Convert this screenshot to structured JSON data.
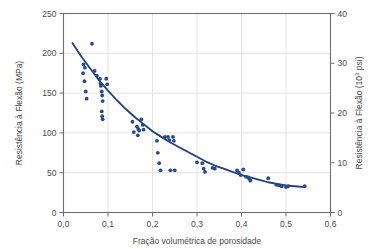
{
  "chart_data": {
    "type": "scatter",
    "title": "",
    "xlabel": "Fração volumétrica de porosidade",
    "ylabel": "Resistência à Flexão (MPa)",
    "ylabel_right_main": "Resistência à Flexão (10",
    "ylabel_right_sup": "3",
    "ylabel_right_tail": " psi)",
    "ylabel_right_full": "Resistência à Flexão (10³ psi)",
    "xlim": [
      0.0,
      0.6
    ],
    "ylim": [
      0,
      250
    ],
    "ylim_right": [
      0,
      40
    ],
    "grid": true,
    "legend": "none",
    "xticks": [
      0.0,
      0.1,
      0.2,
      0.3,
      0.4,
      0.5,
      0.6
    ],
    "xticklabels": [
      "0,0",
      "0,1",
      "0,2",
      "0,3",
      "0,4",
      "0,5",
      "0,6"
    ],
    "yticks": [
      0,
      50,
      100,
      150,
      200,
      250
    ],
    "yticklabels": [
      "0",
      "50",
      "100",
      "150",
      "200",
      "250"
    ],
    "yticks_right": [
      0,
      10,
      20,
      30,
      40
    ],
    "yticklabels_right": [
      "0",
      "10",
      "20",
      "30",
      "40"
    ],
    "marker_color": "#2b4a8b",
    "line_color": "#22407e",
    "grid_color": "#e3e3e3",
    "axis_color": "#6e6e6e",
    "points": [
      {
        "x": 0.045,
        "y": 186
      },
      {
        "x": 0.048,
        "y": 182
      },
      {
        "x": 0.044,
        "y": 175
      },
      {
        "x": 0.047,
        "y": 165
      },
      {
        "x": 0.05,
        "y": 152
      },
      {
        "x": 0.052,
        "y": 143
      },
      {
        "x": 0.064,
        "y": 212
      },
      {
        "x": 0.07,
        "y": 178
      },
      {
        "x": 0.075,
        "y": 172
      },
      {
        "x": 0.082,
        "y": 168
      },
      {
        "x": 0.083,
        "y": 162
      },
      {
        "x": 0.084,
        "y": 159
      },
      {
        "x": 0.086,
        "y": 152
      },
      {
        "x": 0.087,
        "y": 147
      },
      {
        "x": 0.088,
        "y": 140
      },
      {
        "x": 0.086,
        "y": 127
      },
      {
        "x": 0.087,
        "y": 121
      },
      {
        "x": 0.088,
        "y": 117
      },
      {
        "x": 0.096,
        "y": 168
      },
      {
        "x": 0.098,
        "y": 161
      },
      {
        "x": 0.155,
        "y": 114
      },
      {
        "x": 0.158,
        "y": 101
      },
      {
        "x": 0.165,
        "y": 108
      },
      {
        "x": 0.168,
        "y": 105
      },
      {
        "x": 0.17,
        "y": 103
      },
      {
        "x": 0.167,
        "y": 97
      },
      {
        "x": 0.175,
        "y": 117
      },
      {
        "x": 0.178,
        "y": 110
      },
      {
        "x": 0.18,
        "y": 104
      },
      {
        "x": 0.21,
        "y": 90
      },
      {
        "x": 0.212,
        "y": 75
      },
      {
        "x": 0.215,
        "y": 62
      },
      {
        "x": 0.218,
        "y": 53
      },
      {
        "x": 0.228,
        "y": 95
      },
      {
        "x": 0.235,
        "y": 95
      },
      {
        "x": 0.238,
        "y": 91
      },
      {
        "x": 0.24,
        "y": 53
      },
      {
        "x": 0.246,
        "y": 95
      },
      {
        "x": 0.248,
        "y": 90
      },
      {
        "x": 0.25,
        "y": 53
      },
      {
        "x": 0.3,
        "y": 63
      },
      {
        "x": 0.312,
        "y": 62
      },
      {
        "x": 0.315,
        "y": 55
      },
      {
        "x": 0.318,
        "y": 51
      },
      {
        "x": 0.335,
        "y": 56
      },
      {
        "x": 0.34,
        "y": 55
      },
      {
        "x": 0.39,
        "y": 53
      },
      {
        "x": 0.394,
        "y": 50
      },
      {
        "x": 0.398,
        "y": 47
      },
      {
        "x": 0.404,
        "y": 54
      },
      {
        "x": 0.41,
        "y": 45
      },
      {
        "x": 0.415,
        "y": 44
      },
      {
        "x": 0.418,
        "y": 42
      },
      {
        "x": 0.42,
        "y": 40
      },
      {
        "x": 0.46,
        "y": 43
      },
      {
        "x": 0.478,
        "y": 35
      },
      {
        "x": 0.484,
        "y": 34
      },
      {
        "x": 0.49,
        "y": 33
      },
      {
        "x": 0.5,
        "y": 32
      },
      {
        "x": 0.505,
        "y": 33
      },
      {
        "x": 0.542,
        "y": 33
      }
    ],
    "fit_curve": [
      {
        "x": 0.02,
        "y": 213
      },
      {
        "x": 0.04,
        "y": 196
      },
      {
        "x": 0.06,
        "y": 181
      },
      {
        "x": 0.08,
        "y": 166
      },
      {
        "x": 0.1,
        "y": 153
      },
      {
        "x": 0.12,
        "y": 141
      },
      {
        "x": 0.14,
        "y": 130
      },
      {
        "x": 0.16,
        "y": 120
      },
      {
        "x": 0.18,
        "y": 111
      },
      {
        "x": 0.2,
        "y": 102
      },
      {
        "x": 0.22,
        "y": 95
      },
      {
        "x": 0.24,
        "y": 88
      },
      {
        "x": 0.26,
        "y": 82
      },
      {
        "x": 0.28,
        "y": 76
      },
      {
        "x": 0.3,
        "y": 70
      },
      {
        "x": 0.32,
        "y": 64
      },
      {
        "x": 0.34,
        "y": 59
      },
      {
        "x": 0.36,
        "y": 55
      },
      {
        "x": 0.38,
        "y": 51
      },
      {
        "x": 0.4,
        "y": 47
      },
      {
        "x": 0.42,
        "y": 44
      },
      {
        "x": 0.44,
        "y": 41
      },
      {
        "x": 0.46,
        "y": 38
      },
      {
        "x": 0.48,
        "y": 36
      },
      {
        "x": 0.5,
        "y": 34
      },
      {
        "x": 0.52,
        "y": 33
      },
      {
        "x": 0.542,
        "y": 32
      }
    ]
  }
}
